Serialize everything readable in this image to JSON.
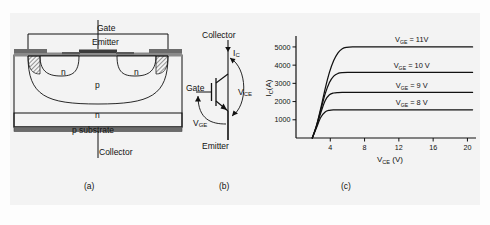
{
  "figure": {
    "background_color": "#f3f3f3",
    "line_color": "#111111",
    "metal_color": "#6b6b6b"
  },
  "panel_a": {
    "caption": "(a)",
    "terminals": {
      "gate": "Gate",
      "emitter": "Emitter",
      "collector": "Collector"
    },
    "regions": [
      {
        "label": "n",
        "name": "n-source-left"
      },
      {
        "label": "n",
        "name": "n-source-right"
      },
      {
        "label": "p",
        "name": "p-body"
      },
      {
        "label": "n",
        "name": "n-drift"
      },
      {
        "label": "p substrate",
        "name": "p-substrate"
      }
    ]
  },
  "panel_b": {
    "caption": "(b)",
    "labels": {
      "collector": "Collector",
      "emitter": "Emitter",
      "gate": "Gate",
      "current_ic": "I",
      "current_ic_sub": "C",
      "vce": "V",
      "vce_sub": "CE",
      "vge": "V",
      "vge_sub": "GE"
    }
  },
  "panel_c": {
    "caption": "(c)"
  },
  "chart_data": {
    "type": "line",
    "title": "",
    "xlabel": "V_CE (V)",
    "xlabel_main": "V",
    "xlabel_sub": "CE",
    "xlabel_unit": " (V)",
    "ylabel": "I_C(A)",
    "ylabel_main": "I",
    "ylabel_sub": "C",
    "ylabel_unit": "(A)",
    "xlim": [
      0,
      21
    ],
    "ylim": [
      0,
      5600
    ],
    "xticks": [
      4,
      8,
      12,
      16,
      20
    ],
    "xtick_labels": [
      "4",
      "8",
      "12",
      "16",
      "20"
    ],
    "yticks": [
      1000,
      2000,
      3000,
      4000,
      5000
    ],
    "ytick_labels": [
      "1000",
      "2000",
      "3000",
      "4000",
      "5000"
    ],
    "grid": false,
    "legend_position": "inline-right",
    "series": [
      {
        "name": "VGE = 11V",
        "label_main": "V",
        "label_sub": "GE",
        "label_rest": " = 11V",
        "saturation": 5000,
        "knee_x": 5.6,
        "onset_x": 1.9,
        "x": [
          1.9,
          2.4,
          2.9,
          3.4,
          3.9,
          4.4,
          4.9,
          5.4,
          5.9,
          6.6,
          8,
          12,
          16,
          20.6
        ],
        "y": [
          0,
          700,
          1650,
          2700,
          3600,
          4250,
          4680,
          4900,
          4975,
          5000,
          5000,
          5000,
          5000,
          5000
        ]
      },
      {
        "name": "VGE = 10 V",
        "label_main": "V",
        "label_sub": "GE",
        "label_rest": " = 10 V",
        "saturation": 3600,
        "knee_x": 4.8,
        "onset_x": 1.9,
        "x": [
          1.9,
          2.4,
          2.9,
          3.4,
          3.9,
          4.4,
          4.9,
          5.4,
          6.2,
          8,
          12,
          16,
          20.6
        ],
        "y": [
          0,
          680,
          1550,
          2420,
          3050,
          3400,
          3545,
          3590,
          3600,
          3600,
          3600,
          3600,
          3600
        ]
      },
      {
        "name": "VGE = 9 V",
        "label_main": "V",
        "label_sub": "GE",
        "label_rest": " = 9 V",
        "saturation": 2500,
        "knee_x": 4.2,
        "onset_x": 1.9,
        "x": [
          1.9,
          2.4,
          2.9,
          3.4,
          3.9,
          4.4,
          4.9,
          5.6,
          8,
          12,
          16,
          20.6
        ],
        "y": [
          0,
          640,
          1400,
          2050,
          2370,
          2470,
          2495,
          2500,
          2500,
          2500,
          2500,
          2500
        ]
      },
      {
        "name": "VGE = 8 V",
        "label_main": "V",
        "label_sub": "GE",
        "label_rest": " = 8 V",
        "saturation": 1550,
        "knee_x": 3.6,
        "onset_x": 1.9,
        "x": [
          1.9,
          2.4,
          2.9,
          3.4,
          3.9,
          4.4,
          5.2,
          8,
          12,
          16,
          20.6
        ],
        "y": [
          0,
          580,
          1140,
          1430,
          1520,
          1545,
          1550,
          1550,
          1550,
          1550,
          1550
        ]
      }
    ]
  }
}
